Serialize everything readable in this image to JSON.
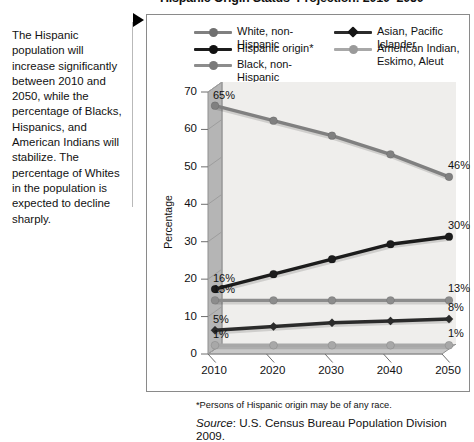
{
  "title": "Hispanic Origin Status–Projection: 2010–2050",
  "callout": {
    "text": "The Hispanic population will increase significantly between 2010 and 2050, while the percentage of Blacks, Hispanics, and American Indians will stabilize. The percentage of Whites in the population is expected to decline sharply."
  },
  "legend": {
    "left_items": [
      {
        "label": "White, non-Hispanic",
        "color": "#808080",
        "marker": "circle"
      },
      {
        "label": "Hispanic origin*",
        "color": "#1c1c1c",
        "marker": "circle"
      },
      {
        "label": "Black, non-Hispanic",
        "color": "#8c8c8c",
        "marker": "circle"
      }
    ],
    "right_items": [
      {
        "label": "Asian, Pacific Islander",
        "label2": "",
        "color": "#2b2b2b",
        "marker": "diamond"
      },
      {
        "label": "American Indian,",
        "label2": "Eskimo, Aleut",
        "color": "#a8a8a8",
        "marker": "circle"
      }
    ]
  },
  "footnote": "*Persons of Hispanic origin may be of any race.",
  "source_word": "Source",
  "source_rest": ": U.S. Census Bureau Population Division 2009.",
  "chart_data": {
    "type": "line",
    "title": "Hispanic Origin Status–Projection: 2010–2050",
    "xlabel": "",
    "ylabel": "Percentage",
    "categories": [
      "2010",
      "2020",
      "2030",
      "2040",
      "2050"
    ],
    "x": [
      2010,
      2020,
      2030,
      2040,
      2050
    ],
    "ylim": [
      0,
      70
    ],
    "yticks": [
      0,
      10,
      20,
      30,
      40,
      50,
      60,
      70
    ],
    "ytick_labels": [
      "0",
      "10",
      "20",
      "30",
      "40",
      "50",
      "60",
      "70"
    ],
    "grid": false,
    "legend_position": "top",
    "series": [
      {
        "name": "White, non-Hispanic",
        "color": "#808080",
        "marker": "circle",
        "values": [
          65,
          61,
          57,
          52,
          46
        ],
        "endpoint_labels": {
          "first": "65%",
          "last": "46%"
        }
      },
      {
        "name": "Hispanic origin*",
        "color": "#1c1c1c",
        "marker": "circle",
        "values": [
          16,
          20,
          24,
          28,
          30
        ],
        "endpoint_labels": {
          "first": "16%",
          "last": "30%"
        }
      },
      {
        "name": "Black, non-Hispanic",
        "color": "#8c8c8c",
        "marker": "circle",
        "values": [
          13,
          13,
          13,
          13,
          13
        ],
        "endpoint_labels": {
          "first": "13%",
          "last": "13%"
        }
      },
      {
        "name": "Asian, Pacific Islander",
        "color": "#2b2b2b",
        "marker": "diamond",
        "values": [
          5,
          6,
          7,
          7.5,
          8
        ],
        "endpoint_labels": {
          "first": "5%",
          "last": "8%"
        }
      },
      {
        "name": "American Indian, Eskimo, Aleut",
        "color": "#a8a8a8",
        "marker": "circle",
        "values": [
          1,
          1,
          1,
          1,
          1
        ],
        "endpoint_labels": {
          "first": "1%",
          "last": "1%"
        }
      }
    ]
  }
}
